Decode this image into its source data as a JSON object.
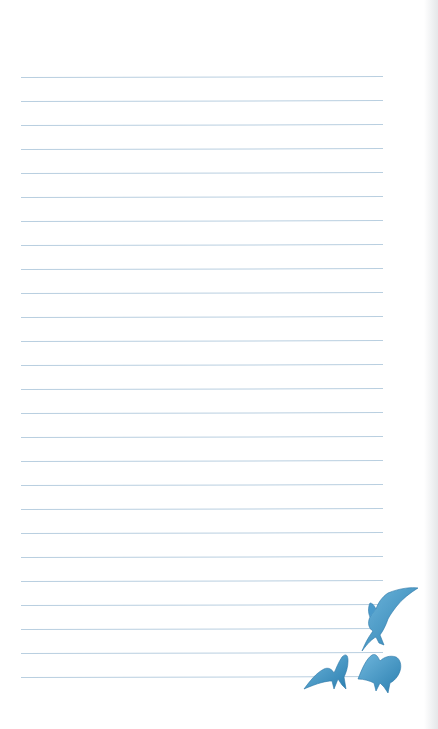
{
  "page": {
    "type": "lined-stationery",
    "background_color": "#ffffff",
    "line_color": "#b9cfe0",
    "line_count": 26,
    "first_line_y": 77,
    "line_spacing": 24,
    "line_left_x": 21,
    "line_right_x": 383
  },
  "illustration": {
    "subject": "three blue birds in flight",
    "color": "#3a8fbf",
    "position": "bottom-right"
  }
}
